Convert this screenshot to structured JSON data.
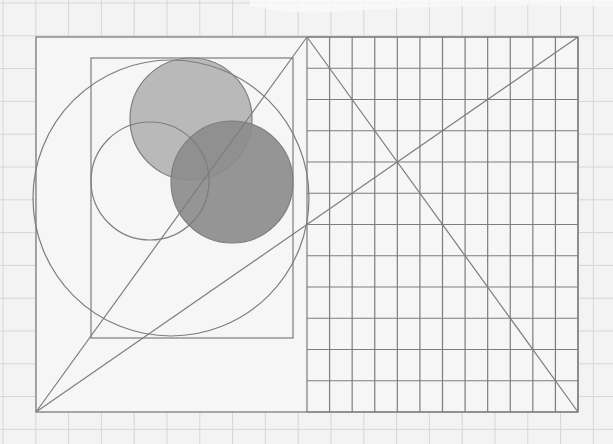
{
  "canvas": {
    "width": 613,
    "height": 444,
    "background": "#f3f3f3"
  },
  "colors": {
    "paper_grid": "#d6d6d6",
    "stroke": "#7d7d7d",
    "light_fill": "#b3b3b3",
    "dark_fill": "#8c8c8c",
    "outer_fill": "#f6f6f6",
    "highlight_patch": "#fafafa"
  },
  "background_grid": {
    "spacing": 32.8,
    "offset_x": 3,
    "offset_y": 3
  },
  "outer_rect": {
    "x": 36,
    "y": 37,
    "w": 542,
    "h": 375
  },
  "inner_rect": {
    "x": 91,
    "y": 58,
    "w": 202,
    "h": 280
  },
  "large_circle": {
    "cx": 171,
    "cy": 198,
    "r": 138
  },
  "circles": [
    {
      "name": "light-circle",
      "cx": 191,
      "cy": 119,
      "r": 61,
      "fill": "light",
      "opacity": 1
    },
    {
      "name": "dark-circle",
      "cx": 232,
      "cy": 182,
      "r": 61,
      "fill": "dark",
      "opacity": 1
    },
    {
      "name": "outline-circle",
      "cx": 150,
      "cy": 181,
      "r": 59,
      "fill": "none",
      "opacity": 1
    }
  ],
  "ruled_panel": {
    "x0": 307,
    "x1": 578,
    "y0": 37,
    "y1": 412,
    "columns": 12,
    "rows": 12
  },
  "lines": [
    {
      "name": "diagonal-left-to-apex",
      "x1": 36,
      "y1": 412,
      "x2": 307,
      "y2": 37
    },
    {
      "name": "diagonal-apex-to-right",
      "x1": 307,
      "y1": 37,
      "x2": 578,
      "y2": 412
    },
    {
      "name": "diagonal-long",
      "x1": 36,
      "y1": 412,
      "x2": 578,
      "y2": 37
    }
  ]
}
